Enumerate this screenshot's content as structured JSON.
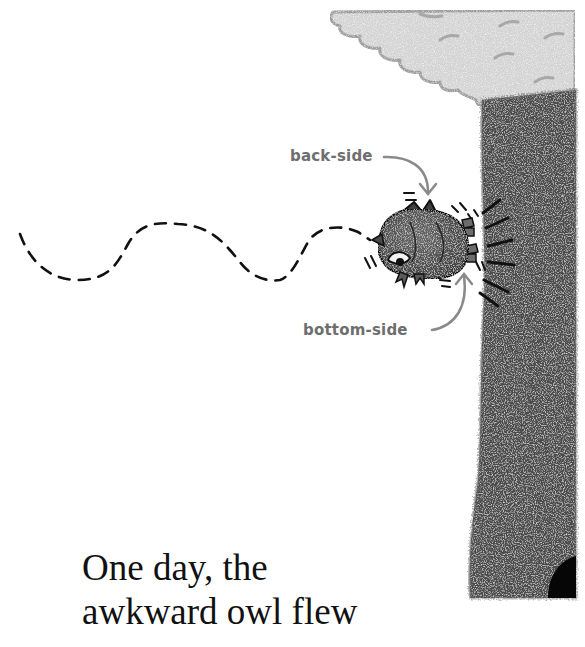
{
  "illustration": {
    "labels": {
      "back_side": "back-side",
      "bottom_side": "bottom-side"
    },
    "colors": {
      "background": "#ffffff",
      "trunk": "#4a4a4a",
      "trunk_dark": "#333333",
      "foliage": "#d3d3d3",
      "foliage_outline": "#9a9a9a",
      "owl_body": "#5a5a5a",
      "owl_dark": "#3a3a3a",
      "label_text": "#6e6e6e",
      "arrow": "#8a8a8a",
      "flight_path": "#111111",
      "hole": "#050505"
    }
  },
  "story": {
    "line1": "One day, the",
    "line2": "awkward owl flew"
  }
}
